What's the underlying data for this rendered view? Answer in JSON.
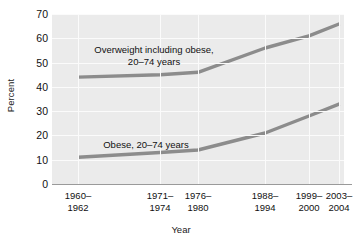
{
  "chart_data": {
    "type": "line",
    "title": "",
    "subtitle": "",
    "xlabel": "Year",
    "ylabel": "Percent",
    "categories": [
      "1960–1962",
      "1971–1974",
      "1976–1980",
      "1988–1994",
      "1999–2000",
      "2003–2004"
    ],
    "category_positions": [
      0.09,
      0.37,
      0.5,
      0.73,
      0.88,
      0.985
    ],
    "series": [
      {
        "name": "Overweight including obese, 20–74 years",
        "values": [
          44,
          45,
          46,
          56,
          61,
          66
        ],
        "color": "#8c8c8c"
      },
      {
        "name": "Obese, 20–74 years",
        "values": [
          11,
          13,
          14,
          21,
          28,
          33
        ],
        "color": "#8c8c8c"
      }
    ],
    "ylim": [
      0,
      70
    ],
    "yticks": [
      0,
      10,
      20,
      30,
      40,
      50,
      60,
      70
    ],
    "ytick_labels": [
      "0",
      "10",
      "20",
      "30",
      "40",
      "50",
      "60",
      "70"
    ],
    "grid": true,
    "legend_position": "inline-annotations",
    "annotations": [
      {
        "id": "overweight-annotation",
        "lines": [
          "Overweight including obese,",
          "20–74 years"
        ],
        "x_px": 154,
        "y_px": 44
      },
      {
        "id": "obese-annotation",
        "lines": [
          "Obese, 20–74 years"
        ],
        "x_px": 146,
        "y_px": 139
      }
    ],
    "colors": {
      "plot_background": "#ebebeb",
      "gridline": "#fbfbfb",
      "axis": "#9a9a9a",
      "line": "#8c8c8c",
      "text": "#111111",
      "page_background": "#ffffff"
    }
  }
}
